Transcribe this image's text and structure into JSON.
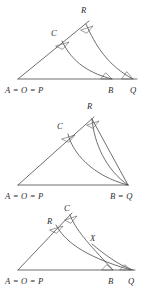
{
  "figure": {
    "line_color": "#4a4a4a",
    "label_color": "#2d2d2d",
    "background": "#ffffff"
  },
  "panels": [
    {
      "id": "panel-1",
      "caption": "",
      "labels": {
        "apex_left": "C",
        "apex_right": "R",
        "base_left": "A = O = P",
        "base_mid": "B",
        "base_right": "Q"
      },
      "points": {
        "A": [
          18,
          79
        ],
        "C": [
          62,
          41
        ],
        "R": [
          86,
          24
        ],
        "B": [
          112,
          79
        ],
        "Q": [
          133,
          79
        ]
      },
      "angle_marks": [
        "C",
        "R",
        "B",
        "Q"
      ]
    },
    {
      "id": "panel-2",
      "caption": "",
      "labels": {
        "apex_left": "C",
        "apex_right": "R",
        "base_left": "A = O = P",
        "base_right": "B = Q"
      },
      "points": {
        "A": [
          18,
          85
        ],
        "C": [
          68,
          34
        ],
        "R": [
          92,
          19
        ],
        "BQ": [
          128,
          85
        ]
      },
      "angle_marks": [
        "C",
        "R"
      ]
    },
    {
      "id": "panel-3",
      "caption": "",
      "labels": {
        "apex_left": "R",
        "apex_right": "C",
        "intersection": "X",
        "base_left": "A = O = P",
        "base_mid": "B",
        "base_right": "Q"
      },
      "points": {
        "A": [
          18,
          66
        ],
        "R": [
          56,
          21
        ],
        "C": [
          70,
          11
        ],
        "X": [
          92,
          40
        ],
        "B": [
          113,
          66
        ],
        "Q": [
          131,
          66
        ]
      },
      "angle_marks": [
        "R",
        "C",
        "B",
        "Q"
      ]
    }
  ]
}
